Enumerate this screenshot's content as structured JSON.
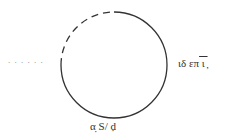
{
  "diagram": {
    "type": "loop",
    "circle": {
      "cx": 114,
      "cy": 65,
      "r": 53,
      "stroke": "#333333",
      "dashed_segment": "upper-left quarter"
    },
    "labels": {
      "left": ". . . . . .",
      "right_main": "ιδ επ",
      "right_over": " ι ̦",
      "bottom": "α̣ S/ ḍ"
    }
  }
}
